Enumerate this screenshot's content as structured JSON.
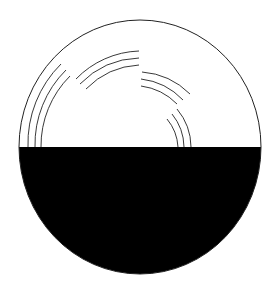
{
  "figure": {
    "colors": {
      "fill": "#000000",
      "background": "#ffffff",
      "stroke": "#222222"
    },
    "circle": {
      "cx": 140,
      "cy": 147,
      "rx": 121,
      "ry": 127
    },
    "arc_groups": [
      {
        "name": "left-arcs",
        "count": 3
      },
      {
        "name": "top-center-arcs",
        "count": 3
      },
      {
        "name": "right-upper-arcs",
        "count": 3
      },
      {
        "name": "right-lower-arcs",
        "count": 3
      }
    ],
    "caption": ""
  }
}
